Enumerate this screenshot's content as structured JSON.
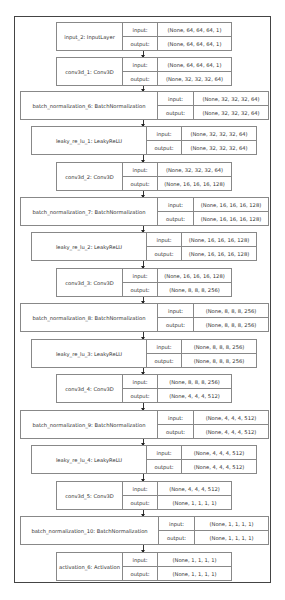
{
  "diagram": {
    "type": "keras-model-plot",
    "io_labels": {
      "input": "input:",
      "output": "output:"
    },
    "layers": [
      {
        "name": "input_2: InputLayer",
        "input": "(None, 64, 64, 64, 1)",
        "output": "(None, 64, 64, 64, 1)"
      },
      {
        "name": "conv3d_1: Conv3D",
        "input": "(None, 64, 64, 64, 1)",
        "output": "(None, 32, 32, 32, 64)"
      },
      {
        "name": "batch_normalization_6: BatchNormalization",
        "input": "(None, 32, 32, 32, 64)",
        "output": "(None, 32, 32, 32, 64)"
      },
      {
        "name": "leaky_re_lu_1: LeakyReLU",
        "input": "(None, 32, 32, 32, 64)",
        "output": "(None, 32, 32, 32, 64)"
      },
      {
        "name": "conv3d_2: Conv3D",
        "input": "(None, 32, 32, 32, 64)",
        "output": "(None, 16, 16, 16, 128)"
      },
      {
        "name": "batch_normalization_7: BatchNormalization",
        "input": "(None, 16, 16, 16, 128)",
        "output": "(None, 16, 16, 16, 128)"
      },
      {
        "name": "leaky_re_lu_2: LeakyReLU",
        "input": "(None, 16, 16, 16, 128)",
        "output": "(None, 16, 16, 16, 128)"
      },
      {
        "name": "conv3d_3: Conv3D",
        "input": "(None, 16, 16, 16, 128)",
        "output": "(None, 8, 8, 8, 256)"
      },
      {
        "name": "batch_normalization_8: BatchNormalization",
        "input": "(None, 8, 8, 8, 256)",
        "output": "(None, 8, 8, 8, 256)"
      },
      {
        "name": "leaky_re_lu_3: LeakyReLU",
        "input": "(None, 8, 8, 8, 256)",
        "output": "(None, 8, 8, 8, 256)"
      },
      {
        "name": "conv3d_4: Conv3D",
        "input": "(None, 8, 8, 8, 256)",
        "output": "(None, 4, 4, 4, 512)"
      },
      {
        "name": "batch_normalization_9: BatchNormalization",
        "input": "(None, 4, 4, 4, 512)",
        "output": "(None, 4, 4, 4, 512)"
      },
      {
        "name": "leaky_re_lu_4: LeakyReLU",
        "input": "(None, 4, 4, 4, 512)",
        "output": "(None, 4, 4, 4, 512)"
      },
      {
        "name": "conv3d_5: Conv3D",
        "input": "(None, 4, 4, 4, 512)",
        "output": "(None, 1, 1, 1, 1)"
      },
      {
        "name": "batch_normalization_10: BatchNormalization",
        "input": "(None, 1, 1, 1, 1)",
        "output": "(None, 1, 1, 1, 1)"
      },
      {
        "name": "activation_6: Activation",
        "input": "(None, 1, 1, 1, 1)",
        "output": "(None, 1, 1, 1, 1)"
      }
    ]
  }
}
